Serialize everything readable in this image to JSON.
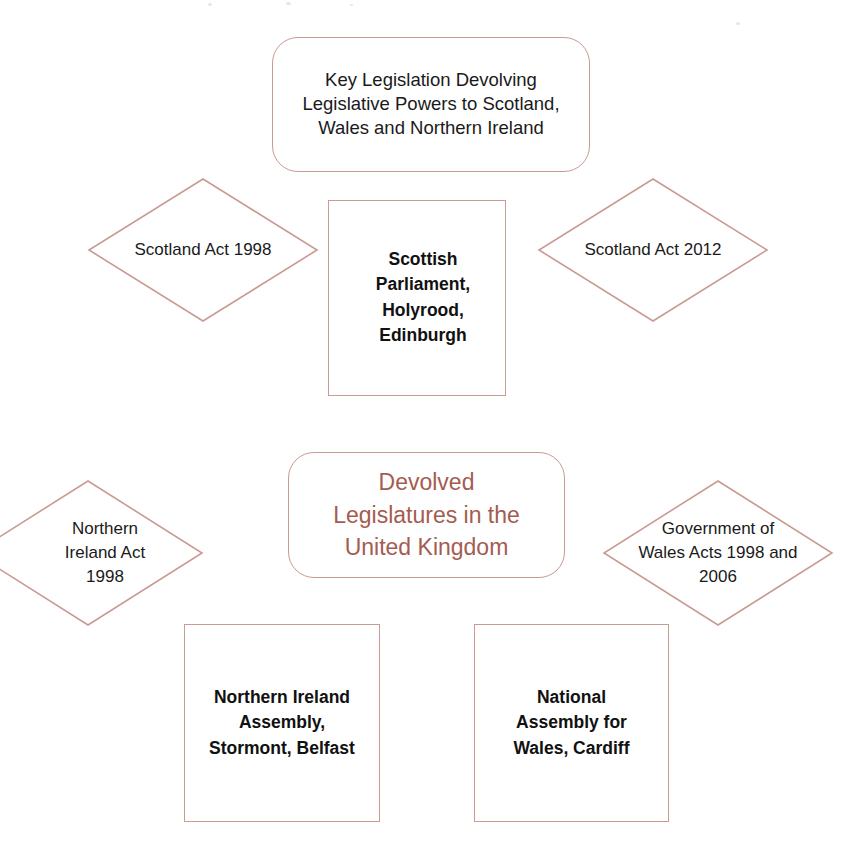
{
  "diagram": {
    "header_box": {
      "label": "Key Legislation Devolving\nLegislative Powers to Scotland,\nWales and Northern Ireland"
    },
    "title_box": {
      "label": "Devolved\nLegislatures in the\nUnited Kingdom"
    },
    "legislation": [
      {
        "id": "scotland-act-1998",
        "label": "Scotland Act 1998"
      },
      {
        "id": "scotland-act-2012",
        "label": "Scotland Act 2012"
      },
      {
        "id": "northern-ireland-act-1998",
        "label": "Northern\nIreland Act\n1998"
      },
      {
        "id": "government-of-wales-acts",
        "label": "Government of\nWales Acts 1998 and\n2006"
      }
    ],
    "legislatures": [
      {
        "id": "scottish-parliament",
        "label": "Scottish\nParliament,\nHolyrood,\nEdinburgh"
      },
      {
        "id": "northern-ireland-assembly",
        "label": "Northern Ireland\nAssembly,\nStormont, Belfast"
      },
      {
        "id": "national-assembly-for-wales",
        "label": "National\nAssembly for\nWales, Cardiff"
      }
    ],
    "colors": {
      "shape_outline": "#c89b93",
      "title_text": "#a45c50",
      "body_text": "#1a1a1a",
      "background": "#ffffff"
    }
  }
}
